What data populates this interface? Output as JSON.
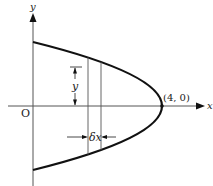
{
  "diagram": {
    "type": "parabola-area-strip",
    "curve": "x = 4 - y^2/4 (parabola opening left, vertex at (4,0))",
    "labels": {
      "y_axis": "y",
      "x_axis": "x",
      "origin": "O",
      "vertex": "(4, 0)",
      "strip_height": "y",
      "strip_width": "δx"
    },
    "colors": {
      "curve": "#111111",
      "axis": "#444444",
      "text": "#222222"
    }
  }
}
